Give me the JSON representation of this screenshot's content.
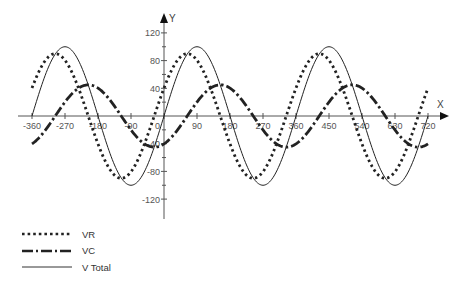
{
  "chart_data": {
    "type": "line",
    "title": "",
    "xlabel": "X",
    "ylabel": "Y",
    "xlim": [
      -360,
      720
    ],
    "ylim": [
      -120,
      120
    ],
    "x_ticks": [
      -360,
      -270,
      -180,
      -90,
      0,
      90,
      180,
      270,
      360,
      450,
      540,
      630,
      720
    ],
    "x_tick_labels": [
      "-360",
      "-270",
      "-180",
      "-90",
      "0",
      "90",
      "180",
      "270",
      "360",
      "450",
      "540",
      "630",
      "720"
    ],
    "y_ticks": [
      -120,
      -80,
      -40,
      0,
      40,
      80,
      120
    ],
    "y_tick_labels": [
      "-120",
      "-80",
      "-40",
      "",
      "40",
      "80",
      "120"
    ],
    "grid": false,
    "legend_position": "bottom-left",
    "series": [
      {
        "name": "VR",
        "style": "dotted",
        "amplitude": 90,
        "phase_deg": 26.6,
        "formula": "90*sin(x+26.6)",
        "x": [
          -360,
          -270,
          -180,
          -90,
          0,
          90,
          180,
          270,
          360,
          450,
          540,
          630,
          720
        ],
        "values": [
          40,
          80,
          -40,
          -80,
          40,
          80,
          -40,
          -80,
          40,
          80,
          -40,
          -80,
          40
        ]
      },
      {
        "name": "VC",
        "style": "dash-dot",
        "amplitude": 45,
        "phase_deg": -63.4,
        "formula": "45*sin(x-63.4)",
        "x": [
          -360,
          -270,
          -180,
          -90,
          0,
          90,
          180,
          270,
          360,
          450,
          540,
          630,
          720
        ],
        "values": [
          -40,
          20,
          40,
          -20,
          -40,
          20,
          40,
          -20,
          -40,
          20,
          40,
          -20,
          -40
        ]
      },
      {
        "name": "V Total",
        "style": "solid",
        "amplitude": 100,
        "phase_deg": 0,
        "formula": "100*sin(x)",
        "x": [
          -360,
          -270,
          -180,
          -90,
          0,
          90,
          180,
          270,
          360,
          450,
          540,
          630,
          720
        ],
        "values": [
          0,
          100,
          0,
          -100,
          0,
          100,
          0,
          -100,
          0,
          100,
          0,
          -100,
          0
        ]
      }
    ]
  },
  "legend": {
    "items": [
      {
        "label": "VR",
        "style": "dotted"
      },
      {
        "label": "VC",
        "style": "dash-dot"
      },
      {
        "label": "V Total",
        "style": "solid"
      }
    ]
  },
  "colors": {
    "axis": "#555555",
    "series": "#222222"
  }
}
